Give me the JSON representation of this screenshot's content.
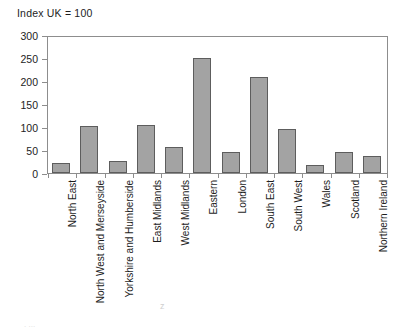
{
  "chart_data": {
    "type": "bar",
    "title": "Index UK = 100",
    "xlabel": "",
    "ylabel": "",
    "ylim": [
      0,
      300
    ],
    "yticks": [
      0,
      50,
      100,
      150,
      200,
      250,
      300
    ],
    "grid": false,
    "legend": null,
    "bar_color": "#a3a3a3",
    "bar_edge_color": "#5d5d5d",
    "axis_color": "#8d8d8d",
    "categories": [
      "North East",
      "North West and Merseyside",
      "Yorkshire and Humberside",
      "East Midlands",
      "West Midlands",
      "Eastern",
      "London",
      "South East",
      "South West",
      "Wales",
      "Scotland",
      "Northern Ireland"
    ],
    "values": [
      21,
      104,
      26,
      105,
      56,
      252,
      46,
      211,
      96,
      17,
      45,
      38
    ]
  }
}
